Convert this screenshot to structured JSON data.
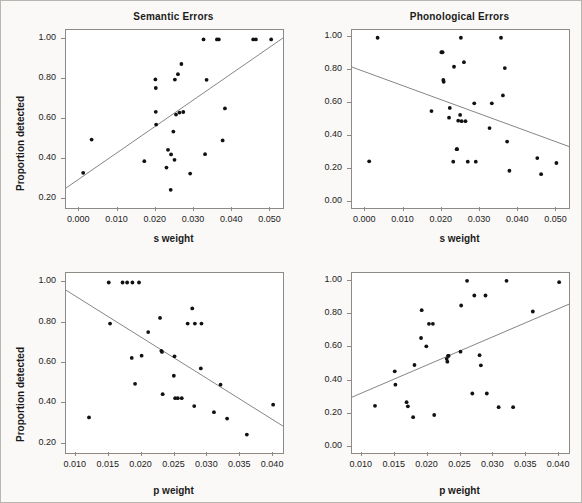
{
  "figure": {
    "background": "#faf9f7",
    "border_color": "#b9b6b1",
    "point_color": "#111111",
    "line_color": "#777777",
    "axis_color": "#8d8a86"
  },
  "chart_data": [
    {
      "id": "semantic-s-weight",
      "type": "scatter",
      "title": "Semantic Errors",
      "xlabel": "s weight",
      "ylabel": "Proportion detected",
      "xlim": [
        -0.0035,
        0.0533
      ],
      "ylim": [
        0.155,
        1.045
      ],
      "xticks": [
        0.0,
        0.01,
        0.02,
        0.03,
        0.04,
        0.05
      ],
      "xticklabels": [
        "0.000",
        "0.010",
        "0.020",
        "0.030",
        "0.040",
        "0.050"
      ],
      "yticks": [
        0.2,
        0.4,
        0.6,
        0.8,
        1.0
      ],
      "yticklabels": [
        "0.20",
        "0.40",
        "0.60",
        "0.80",
        "1.00"
      ],
      "grid": false,
      "legend": "none",
      "trendline": {
        "x0": -0.0035,
        "y0": 0.255,
        "x1": 0.0533,
        "y1": 1.005,
        "slope_sign": "positive"
      },
      "x": [
        0.001,
        0.0032,
        0.017,
        0.0199,
        0.02,
        0.02,
        0.0201,
        0.0228,
        0.0232,
        0.0239,
        0.024,
        0.0246,
        0.0249,
        0.025,
        0.0253,
        0.0258,
        0.0262,
        0.0267,
        0.0272,
        0.029,
        0.0325,
        0.0329,
        0.0333,
        0.036,
        0.0365,
        0.0375,
        0.0381,
        0.0455,
        0.0462,
        0.0502
      ],
      "y": [
        0.331,
        0.497,
        0.389,
        0.798,
        0.755,
        0.636,
        0.572,
        0.357,
        0.446,
        0.246,
        0.423,
        0.537,
        0.396,
        0.797,
        0.622,
        0.824,
        0.632,
        0.875,
        0.635,
        0.327,
        0.998,
        0.424,
        0.796,
        0.998,
        0.998,
        0.493,
        0.653,
        0.998,
        0.998,
        0.998
      ]
    },
    {
      "id": "phonological-s-weight",
      "type": "scatter",
      "title": "Phonological Errors",
      "xlabel": "s weight",
      "ylabel": "",
      "xlim": [
        -0.0035,
        0.0533
      ],
      "ylim": [
        -0.035,
        1.045
      ],
      "xticks": [
        0.0,
        0.01,
        0.02,
        0.03,
        0.04,
        0.05
      ],
      "xticklabels": [
        "0.000",
        "0.010",
        "0.020",
        "0.030",
        "0.040",
        "0.050"
      ],
      "yticks": [
        0.0,
        0.2,
        0.4,
        0.6,
        0.8,
        1.0
      ],
      "yticklabels": [
        "0.00",
        "0.20",
        "0.40",
        "0.60",
        "0.80",
        "1.00"
      ],
      "grid": false,
      "legend": "none",
      "trendline": {
        "x0": -0.0035,
        "y0": 0.82,
        "x1": 0.0533,
        "y1": 0.338,
        "slope_sign": "negative"
      },
      "x": [
        0.001,
        0.0032,
        0.0173,
        0.0199,
        0.0202,
        0.0204,
        0.0205,
        0.0219,
        0.0221,
        0.023,
        0.0232,
        0.0239,
        0.024,
        0.0243,
        0.0248,
        0.025,
        0.0252,
        0.0258,
        0.0262,
        0.0268,
        0.0285,
        0.0289,
        0.0325,
        0.0331,
        0.0355,
        0.036,
        0.0365,
        0.0371,
        0.0377,
        0.045,
        0.046,
        0.05
      ],
      "y": [
        0.248,
        0.998,
        0.553,
        0.91,
        0.91,
        0.742,
        0.731,
        0.513,
        0.572,
        0.246,
        0.822,
        0.322,
        0.322,
        0.495,
        0.53,
        0.998,
        0.492,
        0.85,
        0.492,
        0.246,
        0.6,
        0.246,
        0.45,
        0.6,
        0.998,
        0.648,
        0.814,
        0.368,
        0.191,
        0.268,
        0.17,
        0.238
      ]
    },
    {
      "id": "semantic-p-weight",
      "type": "scatter",
      "title": "",
      "xlabel": "p weight",
      "ylabel": "Proportion detected",
      "xlim": [
        0.0085,
        0.0415
      ],
      "ylim": [
        0.155,
        1.045
      ],
      "xticks": [
        0.01,
        0.015,
        0.02,
        0.025,
        0.03,
        0.035,
        0.04
      ],
      "xticklabels": [
        "0.010",
        "0.015",
        "0.020",
        "0.025",
        "0.030",
        "0.035",
        "0.040"
      ],
      "yticks": [
        0.2,
        0.4,
        0.6,
        0.8,
        1.0
      ],
      "yticklabels": [
        "0.20",
        "0.40",
        "0.60",
        "0.80",
        "1.00"
      ],
      "grid": false,
      "legend": "none",
      "trendline": {
        "x0": 0.0085,
        "y0": 0.96,
        "x1": 0.0415,
        "y1": 0.288,
        "slope_sign": "negative"
      },
      "x": [
        0.012,
        0.015,
        0.0152,
        0.0171,
        0.0178,
        0.0185,
        0.0186,
        0.019,
        0.0196,
        0.02,
        0.021,
        0.0228,
        0.023,
        0.0231,
        0.0232,
        0.0249,
        0.025,
        0.0251,
        0.0255,
        0.0261,
        0.027,
        0.0277,
        0.028,
        0.0281,
        0.029,
        0.0291,
        0.031,
        0.032,
        0.033,
        0.036,
        0.04
      ],
      "y": [
        0.331,
        0.998,
        0.795,
        0.998,
        0.998,
        0.625,
        0.998,
        0.497,
        0.998,
        0.636,
        0.753,
        0.823,
        0.66,
        0.655,
        0.446,
        0.537,
        0.633,
        0.426,
        0.426,
        0.426,
        0.795,
        0.87,
        0.387,
        0.795,
        0.573,
        0.795,
        0.357,
        0.493,
        0.325,
        0.246,
        0.394
      ]
    },
    {
      "id": "phonological-p-weight",
      "type": "scatter",
      "title": "",
      "xlabel": "p weight",
      "ylabel": "",
      "xlim": [
        0.0085,
        0.0415
      ],
      "ylim": [
        -0.035,
        1.045
      ],
      "xticks": [
        0.01,
        0.015,
        0.02,
        0.025,
        0.03,
        0.035,
        0.04
      ],
      "xticklabels": [
        "0.010",
        "0.015",
        "0.020",
        "0.025",
        "0.030",
        "0.035",
        "0.040"
      ],
      "yticks": [
        0.0,
        0.2,
        0.4,
        0.6,
        0.8,
        1.0
      ],
      "yticklabels": [
        "0.00",
        "0.20",
        "0.40",
        "0.60",
        "0.80",
        "1.00"
      ],
      "grid": false,
      "legend": "none",
      "trendline": {
        "x0": 0.0085,
        "y0": 0.3,
        "x1": 0.0415,
        "y1": 0.858,
        "slope_sign": "positive"
      },
      "x": [
        0.012,
        0.015,
        0.0151,
        0.0168,
        0.017,
        0.0178,
        0.018,
        0.019,
        0.0191,
        0.0198,
        0.0202,
        0.0208,
        0.021,
        0.0229,
        0.023,
        0.0231,
        0.0232,
        0.025,
        0.0251,
        0.026,
        0.0268,
        0.0271,
        0.0279,
        0.0281,
        0.0288,
        0.029,
        0.0308,
        0.032,
        0.033,
        0.036,
        0.04
      ],
      "y": [
        0.248,
        0.455,
        0.375,
        0.27,
        0.245,
        0.18,
        0.493,
        0.655,
        0.822,
        0.605,
        0.74,
        0.74,
        0.193,
        0.53,
        0.513,
        0.548,
        0.548,
        0.573,
        0.85,
        0.998,
        0.322,
        0.91,
        0.552,
        0.491,
        0.91,
        0.322,
        0.24,
        0.998,
        0.24,
        0.814,
        0.99
      ]
    }
  ],
  "panels": {
    "top_left": {
      "title": "Semantic Errors",
      "xlabel": "s weight",
      "ylabel": "Proportion detected"
    },
    "top_right": {
      "title": "Phonological Errors",
      "xlabel": "s weight",
      "ylabel": ""
    },
    "bottom_left": {
      "title": "",
      "xlabel": "p weight",
      "ylabel": "Proportion detected"
    },
    "bottom_right": {
      "title": "",
      "xlabel": "p weight",
      "ylabel": ""
    }
  }
}
